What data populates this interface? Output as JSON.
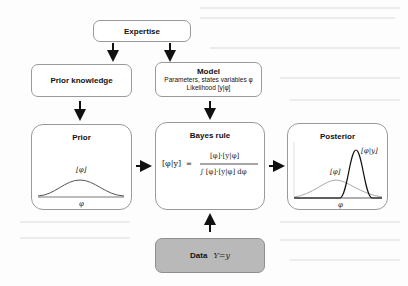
{
  "diagram": {
    "expertise": {
      "label": "Expertise"
    },
    "prior_knowledge": {
      "label": "Prior knowledge"
    },
    "model": {
      "title": "Model",
      "line1": "Parameters, states variables φ",
      "line2": "Likelihood [y|φ]"
    },
    "prior": {
      "title": "Prior",
      "curve_label": "[φ]",
      "axis_label": "φ"
    },
    "bayes_rule": {
      "title": "Bayes rule",
      "lhs": "[φ|y]",
      "equals": "=",
      "numerator": "[φ]·[y|φ]",
      "denominator": "∫ [φ]·[y|φ] dφ"
    },
    "posterior": {
      "title": "Posterior",
      "prior_label": "[φ]",
      "posterior_label": "[φ|y]",
      "axis_label": "φ"
    },
    "data": {
      "label": "Data",
      "expression": "Y=y"
    },
    "colors": {
      "box_border": "#9a9a9a",
      "data_fill": "#b9b9b9",
      "arrow": "#111111",
      "prior_curve": "#555555",
      "posterior_prior_curve": "#aaaaaa",
      "posterior_curve": "#111111"
    }
  }
}
